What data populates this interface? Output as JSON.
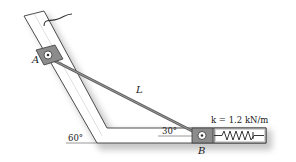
{
  "figure": {
    "labels": {
      "collar_a": "A",
      "collar_b": "B",
      "rod": "L",
      "spring_constant": "k = 1.2 kN/m",
      "angle_incline": "60°",
      "angle_rod": "30°"
    },
    "colors": {
      "guide_fill": "#ffffff",
      "guide_stroke": "#3a3a3a",
      "shadow": "#bdbdbd",
      "collar_fill": "#8c8c8c",
      "rod": "#6e6e6e",
      "spring": "#222222"
    }
  }
}
